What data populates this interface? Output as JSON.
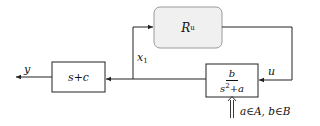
{
  "diagram": {
    "type": "block-diagram",
    "blocks": [
      {
        "id": "controller",
        "label": "R",
        "label_sub": "u",
        "shape": "rounded-rect",
        "fill": "#f0f0f0"
      },
      {
        "id": "output_block",
        "label": "s+c",
        "shape": "rect",
        "fill": "#ffffff"
      },
      {
        "id": "plant",
        "numerator": "b",
        "denominator": "s",
        "denominator_sup": "2",
        "denominator_rest": "+a",
        "shape": "rect",
        "fill": "#ffffff"
      }
    ],
    "signals": {
      "y": "y",
      "x1": "x",
      "x1_sub": "1",
      "u": "u"
    },
    "parameter_label": "a∈A, b∈B",
    "edges": [
      {
        "from": "plant",
        "to": "output_block",
        "signal": "x1"
      },
      {
        "from": "plant",
        "to": "controller",
        "signal": "x1"
      },
      {
        "from": "controller",
        "to": "plant",
        "signal": "u"
      },
      {
        "from": "output_block",
        "to": "output",
        "signal": "y"
      },
      {
        "from": "parameters",
        "to": "plant",
        "style": "double-arrow"
      }
    ],
    "colors": {
      "line": "#222222",
      "controller_fill": "#f0f0f0",
      "controller_border": "#999999"
    }
  }
}
